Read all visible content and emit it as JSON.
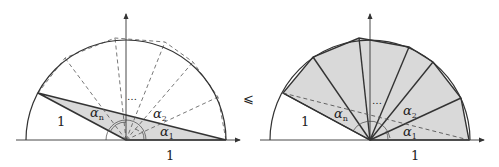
{
  "figure": {
    "relation_symbol": "⩽",
    "left": {
      "radius_label": "1",
      "base_label": "1",
      "angle_labels": {
        "first": "α",
        "first_sub": "1",
        "second": "α",
        "second_sub": "2",
        "last": "α",
        "last_sub": "n"
      },
      "ellipsis": "…",
      "description": "Unit semicircle with dashed radii splitting into angles α1…αn; shaded single triangle spanning total angle"
    },
    "right": {
      "radius_label": "1",
      "base_label": "1",
      "angle_labels": {
        "first": "α",
        "first_sub": "1",
        "second": "α",
        "second_sub": "2",
        "last": "α",
        "last_sub": "n"
      },
      "ellipsis": "…",
      "description": "Same semicircle with shaded fan of n triangles; dashed chord of the single triangle"
    },
    "colors": {
      "stroke": "#333333",
      "fill": "#d9d9d9",
      "dash": "#555555"
    }
  }
}
